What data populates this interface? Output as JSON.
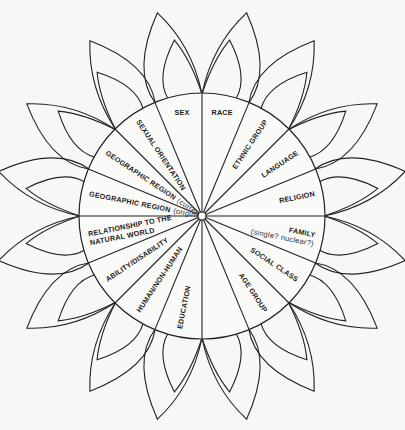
{
  "diagram": {
    "center": [
      202,
      216
    ],
    "radius": 123,
    "hub_radius": 4,
    "sector_count": 16,
    "colors": {
      "stroke": "#222222",
      "background": "#f7f7f5",
      "text": "#1a1a1a"
    },
    "sectors": [
      {
        "index": 0,
        "label": "RACE",
        "sub": ""
      },
      {
        "index": 1,
        "label": "ETHNIC GROUP",
        "sub": ""
      },
      {
        "index": 2,
        "label": "LANGUAGE",
        "sub": ""
      },
      {
        "index": 3,
        "label": "RELIGION",
        "sub": ""
      },
      {
        "index": 4,
        "label": "FAMILY",
        "sub": "(single? nuclear?)"
      },
      {
        "index": 5,
        "label": "SOCIAL CLASS",
        "sub": ""
      },
      {
        "index": 6,
        "label": "AGE GROUP",
        "sub": ""
      },
      {
        "index": 7,
        "label": "",
        "sub": ""
      },
      {
        "index": 8,
        "label": "EDUCATION",
        "sub": ""
      },
      {
        "index": 9,
        "label": "HUMAN/NON-HUMAN",
        "sub": ""
      },
      {
        "index": 10,
        "label": "ABILITY/DISABILITY",
        "sub": ""
      },
      {
        "index": 11,
        "label": "RELATIONSHIP TO THE",
        "label2": "NATURAL WORLD",
        "sub": ""
      },
      {
        "index": 12,
        "label": "GEOGRAPHIC REGION",
        "sub": "(origin)"
      },
      {
        "index": 13,
        "label": "GEOGRAPHIC REGION",
        "sub": "(current)"
      },
      {
        "index": 14,
        "label": "SEXUAL ORIENTATION",
        "sub": ""
      },
      {
        "index": 15,
        "label": "SEX",
        "sub": ""
      }
    ],
    "petals": {
      "origin_step_deg": 45,
      "outer_tip_radius": 208,
      "inner_tip_radius": 178
    }
  }
}
